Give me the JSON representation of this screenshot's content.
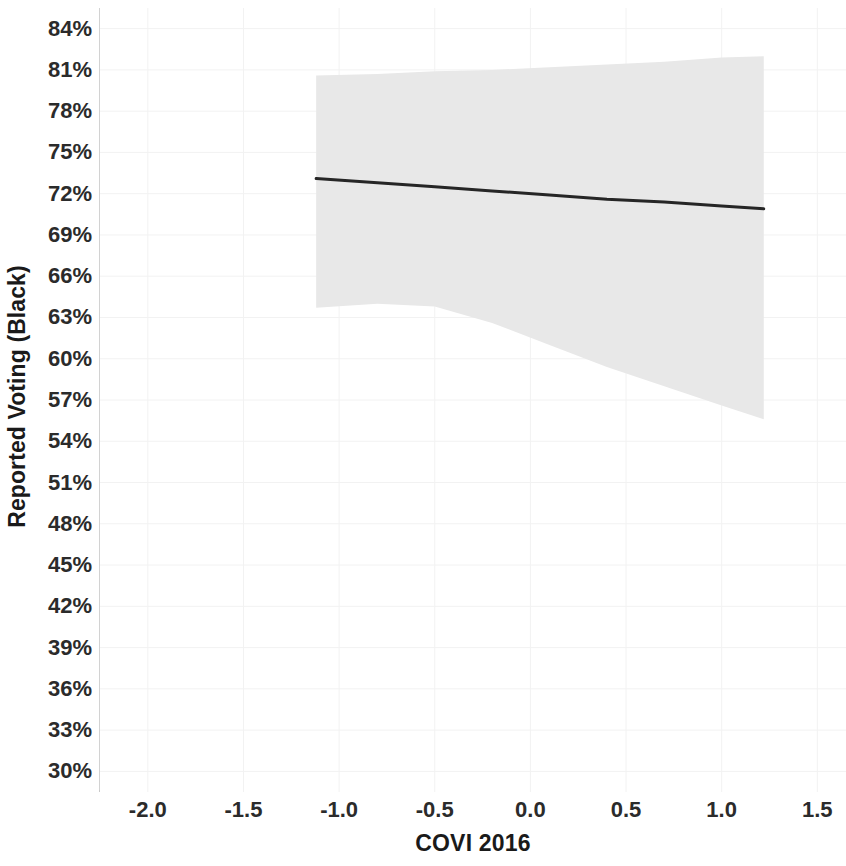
{
  "chart_data": {
    "type": "line",
    "title": "",
    "subtitle": "",
    "xlabel": "COVI 2016",
    "ylabel": "Reported Voting (Black)",
    "xlim": [
      -2.25,
      1.65
    ],
    "ylim": [
      28.5,
      85.5
    ],
    "xticks": [
      -2.0,
      -1.5,
      -1.0,
      -0.5,
      0.0,
      0.5,
      1.0,
      1.5
    ],
    "xticklabels": [
      "-2.0",
      "-1.5",
      "-1.0",
      "-0.5",
      "0.0",
      "0.5",
      "1.0",
      "1.5"
    ],
    "yticks": [
      30,
      33,
      36,
      39,
      42,
      45,
      48,
      51,
      54,
      57,
      60,
      63,
      66,
      69,
      72,
      75,
      78,
      81,
      84
    ],
    "yticklabels": [
      "30%",
      "33%",
      "36%",
      "39%",
      "42%",
      "45%",
      "48%",
      "51%",
      "54%",
      "57%",
      "60%",
      "63%",
      "66%",
      "69%",
      "72%",
      "75%",
      "78%",
      "81%",
      "84%"
    ],
    "grid": true,
    "grid_color": "#f2f2f2",
    "legend": null,
    "legend_position": "none",
    "annotations": [],
    "series": [
      {
        "name": "Predicted reported voting (Black)",
        "type": "line",
        "color": "#262626",
        "linewidth": 3,
        "x": [
          -1.12,
          -0.8,
          -0.5,
          -0.2,
          0.1,
          0.4,
          0.7,
          1.0,
          1.22
        ],
        "values": [
          73.1,
          72.8,
          72.5,
          72.2,
          71.9,
          71.6,
          71.4,
          71.1,
          70.9
        ]
      },
      {
        "name": "95% confidence interval",
        "type": "band",
        "color": "#e8e8e8",
        "opacity": 1,
        "x": [
          -1.12,
          -0.8,
          -0.5,
          -0.2,
          0.1,
          0.4,
          0.7,
          1.0,
          1.22
        ],
        "upper": [
          80.6,
          80.7,
          80.9,
          81.0,
          81.2,
          81.4,
          81.6,
          81.9,
          82.0
        ],
        "lower": [
          63.7,
          64.0,
          63.8,
          62.6,
          61.0,
          59.4,
          58.0,
          56.6,
          55.6
        ]
      }
    ],
    "x_data_range": [
      -1.12,
      1.22
    ],
    "slope_per_unit": -0.94,
    "intercept_at_zero": 72.0
  },
  "axes": {
    "spine_color": "#cfcfcf",
    "tick_label_color": "#2b2b2b",
    "axis_title_color": "#1a1a1a"
  },
  "colors": {
    "line": "#262626",
    "band": "#e9e9e9",
    "grid": "#f1f1f1",
    "background": "#ffffff"
  }
}
